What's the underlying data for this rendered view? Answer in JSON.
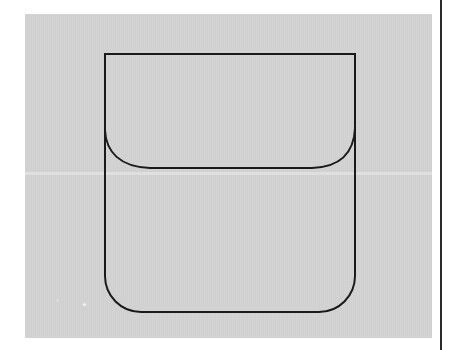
{
  "document": {
    "kind": "scanned-line-drawing",
    "background_color": "#ffffff",
    "panel_color": "#d3d3d3",
    "ink_color": "#1a1a1a",
    "panel": {
      "x": 25,
      "y": 14,
      "width": 407,
      "height": 324
    }
  },
  "margin_rule": {
    "name": "right-margin-rule",
    "x": 440,
    "width": 2,
    "color": "#2b2b2b"
  },
  "artifacts": [
    {
      "name": "dust-speck",
      "x": 83,
      "y": 303,
      "color": "#f4f4f4"
    },
    {
      "name": "dust-speck",
      "x": 56,
      "y": 299,
      "color": "#dcdcdc"
    }
  ],
  "figure": {
    "title": "",
    "caption": "",
    "stroke_color": "#1a1a1a",
    "stroke_width": 2.0,
    "fill": "none",
    "geometry": {
      "outer_left_x": 105,
      "outer_right_x": 355,
      "outer_top_y": 54,
      "outer_bottom_y": 312,
      "top_corner_radius": 0,
      "bottom_corner_radius": 36,
      "inner_curve": {
        "name": "inner-bowed-curve",
        "left_start": [
          105,
          130
        ],
        "right_end": [
          355,
          128
        ],
        "lowest_y": 168,
        "flat_span_x": [
          150,
          312
        ]
      }
    },
    "paths": {
      "outline": "M 105 54 L 355 54 L 355 276 A 36 36 0 0 1 319 312 L 141 312 A 36 36 0 0 1 105 276 L 105 54 Z",
      "inner_curve": "M 105 130 C 106 152 120 167 150 168 L 312 168 C 342 167 354 151 355 128"
    }
  }
}
